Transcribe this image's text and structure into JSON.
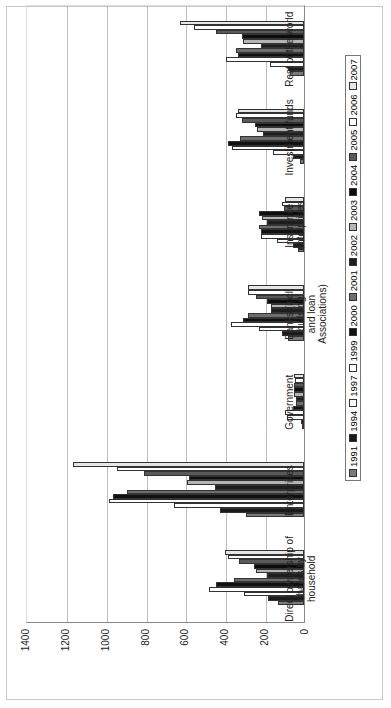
{
  "chart_data": {
    "type": "bar",
    "orientation": "vertical bars, image rotated 90 degrees counter-clockwise",
    "title": "",
    "xlabel": "",
    "ylabel": "",
    "ylim": [
      0,
      1400
    ],
    "yticks": [
      "0",
      "200",
      "400",
      "600",
      "800",
      "1000",
      "1200",
      "1400"
    ],
    "grid": true,
    "legend_position": "bottom",
    "categories": [
      "Direct ownership of shares by household",
      "Enterprises",
      "Government",
      "Banks (incl. building and loan Associations)",
      "Insurance enterprises",
      "Investment funds",
      "Rest of the world"
    ],
    "category_lines": [
      [
        "Direct ownership of",
        "shares by household"
      ],
      [
        "Enterprises"
      ],
      [
        "Government"
      ],
      [
        "Banks (incl. building",
        "and loan",
        "Associations)"
      ],
      [
        "Insurance",
        "enterprises"
      ],
      [
        "Investment funds"
      ],
      [
        "Rest of the world"
      ]
    ],
    "series": [
      {
        "name": "1991",
        "color": "#7a7a7a",
        "values": [
          130,
          290,
          10,
          80,
          30,
          20,
          70
        ]
      },
      {
        "name": "1994",
        "color": "#1a1a1a",
        "values": [
          180,
          420,
          15,
          110,
          55,
          55,
          80
        ]
      },
      {
        "name": "1997",
        "color": "#ffffff",
        "values": [
          300,
          650,
          85,
          225,
          135,
          155,
          170
        ]
      },
      {
        "name": "1999",
        "color": "#ffffff",
        "values": [
          475,
          980,
          95,
          365,
          215,
          360,
          390
        ]
      },
      {
        "name": "2000",
        "color": "#111111",
        "values": [
          440,
          960,
          55,
          305,
          215,
          380,
          330
        ]
      },
      {
        "name": "2001",
        "color": "#6e6e6e",
        "values": [
          350,
          890,
          40,
          280,
          225,
          320,
          340
        ]
      },
      {
        "name": "2002",
        "color": "#1e1e1e",
        "values": [
          185,
          445,
          40,
          165,
          185,
          205,
          215
        ]
      },
      {
        "name": "2003",
        "color": "#b4b4b4",
        "values": [
          240,
          585,
          50,
          165,
          210,
          235,
          305
        ]
      },
      {
        "name": "2004",
        "color": "#0d0d0d",
        "values": [
          250,
          575,
          50,
          185,
          225,
          245,
          310
        ]
      },
      {
        "name": "2005",
        "color": "#5a5a5a",
        "values": [
          325,
          805,
          50,
          240,
          100,
          310,
          440
        ]
      },
      {
        "name": "2006",
        "color": "#ffffff",
        "values": [
          380,
          940,
          45,
          280,
          110,
          340,
          550
        ]
      },
      {
        "name": "2007",
        "color": "#e6e6e6",
        "values": [
          395,
          1160,
          50,
          280,
          95,
          330,
          620
        ]
      }
    ]
  }
}
